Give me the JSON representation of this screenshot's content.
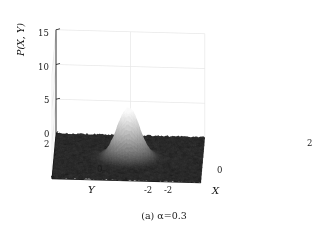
{
  "figure": {
    "caption_prefix": "(a)",
    "caption_text": "(a) α=0.3"
  },
  "chart_data": {
    "type": "surface",
    "title": "",
    "subtitle": "",
    "caption": "(a) α=0.3",
    "parameter": {
      "name": "α",
      "value": 0.3
    },
    "xlabel": "X",
    "ylabel": "Y",
    "zlabel": "P(X, Y)",
    "xlim": [
      -2,
      2
    ],
    "ylim": [
      -2,
      2
    ],
    "zlim": [
      0,
      15
    ],
    "xticks": [
      -2,
      0,
      2
    ],
    "yticks": [
      -2,
      0,
      2
    ],
    "zticks": [
      0,
      5,
      10,
      15
    ],
    "xtick_labels": [
      "-2",
      "0",
      "2"
    ],
    "ytick_labels": [
      "-2",
      "0",
      "2"
    ],
    "ztick_labels": [
      "0",
      "5",
      "10",
      "15"
    ],
    "grid": true,
    "legend": false,
    "colormap": "gray",
    "surface_description": "Noisy dark baseline plane near P=0 across the X-Y domain with a single bright Gaussian-like peak centered near the origin.",
    "peak": {
      "x": 0.0,
      "y": 0.0,
      "z": 7.2
    },
    "baseline_level": 0.15,
    "colors": {
      "baseline": "#2b2b2b",
      "peak_high": "#f2f2f2",
      "peak_mid": "#9a9a9a",
      "axis_line": "#1a1a1a",
      "grid_line": "#e8e8e8",
      "background": "#ffffff"
    },
    "view": {
      "azimuth": -37.5,
      "elevation": 30
    },
    "surface_samples": {
      "x": [
        -2.0,
        -1.5,
        -1.0,
        -0.5,
        0.0,
        0.5,
        1.0,
        1.5,
        2.0
      ],
      "y": [
        -2.0,
        -1.5,
        -1.0,
        -0.5,
        0.0,
        0.5,
        1.0,
        1.5,
        2.0
      ],
      "z": [
        [
          0.0,
          0.0,
          0.0,
          0.0,
          0.0,
          0.0,
          0.0,
          0.0,
          0.0
        ],
        [
          0.0,
          0.0,
          0.0,
          0.0,
          0.1,
          0.0,
          0.0,
          0.0,
          0.0
        ],
        [
          0.0,
          0.0,
          0.1,
          0.2,
          0.3,
          0.2,
          0.1,
          0.0,
          0.0
        ],
        [
          0.0,
          0.0,
          0.2,
          1.1,
          1.9,
          1.1,
          0.2,
          0.0,
          0.0
        ],
        [
          0.0,
          0.1,
          0.3,
          1.9,
          7.2,
          1.9,
          0.3,
          0.1,
          0.0
        ],
        [
          0.0,
          0.0,
          0.2,
          1.1,
          1.9,
          1.1,
          0.2,
          0.0,
          0.0
        ],
        [
          0.0,
          0.0,
          0.1,
          0.2,
          0.3,
          0.2,
          0.1,
          0.0,
          0.0
        ],
        [
          0.0,
          0.0,
          0.0,
          0.0,
          0.1,
          0.0,
          0.0,
          0.0,
          0.0
        ],
        [
          0.0,
          0.0,
          0.0,
          0.0,
          0.0,
          0.0,
          0.0,
          0.0,
          0.0
        ]
      ]
    }
  },
  "axes": {
    "z": {
      "title": "P(X, Y)",
      "ticks": [
        {
          "label": "15",
          "left": 38,
          "top": 29
        },
        {
          "label": "10",
          "left": 38,
          "top": 63
        },
        {
          "label": "5",
          "left": 44,
          "top": 96
        },
        {
          "label": "0",
          "left": 44,
          "top": 130
        }
      ]
    },
    "y": {
      "title": "Y",
      "title_pos": {
        "left": 88,
        "top": 185
      },
      "ticks": [
        {
          "label": "2",
          "left": 44,
          "top": 140
        },
        {
          "label": "0",
          "left": 97,
          "top": 165
        },
        {
          "label": "-2",
          "left": 144,
          "top": 186
        }
      ]
    },
    "x": {
      "title": "X",
      "title_pos": {
        "left": 212,
        "top": 186
      },
      "ticks": [
        {
          "label": "-2",
          "left": 164,
          "top": 186
        },
        {
          "label": "0",
          "left": 217,
          "top": 166
        },
        {
          "label": "2",
          "left": 307,
          "top": 139
        }
      ]
    }
  }
}
